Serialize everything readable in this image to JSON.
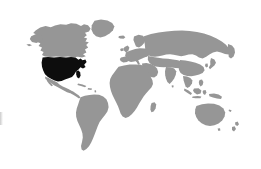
{
  "map": {
    "title": "World map",
    "type": "choropleth-world-map",
    "projection": "equirectangular-style world outline",
    "background_color": "#ffffff",
    "land_color": "#969696",
    "highlight_color": "#0d0d0d",
    "width": 261,
    "height": 169,
    "highlighted_regions": [
      {
        "name": "United States",
        "code": "US",
        "color": "#0d0d0d",
        "label": "United States"
      }
    ],
    "regions": [
      {
        "name": "North America",
        "color": "#969696"
      },
      {
        "name": "Greenland",
        "color": "#969696"
      },
      {
        "name": "Canada",
        "color": "#969696"
      },
      {
        "name": "Mexico",
        "color": "#969696"
      },
      {
        "name": "Central America",
        "color": "#969696"
      },
      {
        "name": "Caribbean",
        "color": "#969696"
      },
      {
        "name": "South America",
        "color": "#969696"
      },
      {
        "name": "Europe",
        "color": "#969696"
      },
      {
        "name": "Africa",
        "color": "#969696"
      },
      {
        "name": "Madagascar",
        "color": "#969696"
      },
      {
        "name": "Asia",
        "color": "#969696"
      },
      {
        "name": "Russia",
        "color": "#969696"
      },
      {
        "name": "India",
        "color": "#969696"
      },
      {
        "name": "Southeast Asia",
        "color": "#969696"
      },
      {
        "name": "Indonesia",
        "color": "#969696"
      },
      {
        "name": "Japan",
        "color": "#969696"
      },
      {
        "name": "Australia",
        "color": "#969696"
      },
      {
        "name": "New Zealand",
        "color": "#969696"
      },
      {
        "name": "United Kingdom",
        "color": "#969696"
      },
      {
        "name": "Iceland",
        "color": "#969696"
      }
    ],
    "legend": [],
    "labels": []
  }
}
